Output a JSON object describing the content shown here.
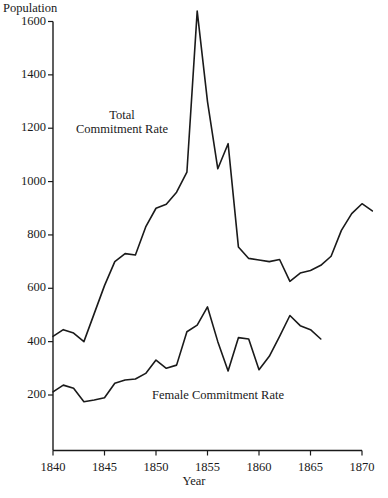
{
  "axes": {
    "y_title": "Population",
    "x_title": "Year",
    "y_ticks": [
      1600,
      1400,
      1200,
      1000,
      800,
      600,
      400,
      200
    ],
    "x_ticks": [
      1840,
      1845,
      1850,
      1855,
      1860,
      1865,
      1870
    ]
  },
  "labels": {
    "total_line1": "Total",
    "total_line2": "Commitment Rate",
    "female": "Female Commitment Rate"
  },
  "style": {
    "line_color": "#1a1a1a",
    "axis_color": "#1a1a1a",
    "background": "#ffffff"
  },
  "chart_data": {
    "type": "line",
    "title": "",
    "xlabel": "Year",
    "ylabel": "Population",
    "xlim": [
      1840,
      1870
    ],
    "ylim": [
      0,
      1600
    ],
    "grid": false,
    "legend": "inline-annotations",
    "x": [
      1840,
      1841,
      1842,
      1843,
      1844,
      1845,
      1846,
      1847,
      1848,
      1849,
      1850,
      1851,
      1852,
      1853,
      1854,
      1855,
      1856,
      1857,
      1858,
      1859,
      1860,
      1861,
      1862,
      1863,
      1864,
      1865,
      1866,
      1867,
      1868,
      1869,
      1870,
      1871
    ],
    "series": [
      {
        "name": "Total Commitment Rate",
        "values": [
          420,
          445,
          432,
          400,
          505,
          610,
          700,
          730,
          725,
          830,
          900,
          915,
          960,
          1035,
          1639,
          1300,
          1048,
          1142,
          755,
          712,
          706,
          700,
          708,
          626,
          657,
          667,
          686,
          720,
          817,
          880,
          917,
          890
        ]
      },
      {
        "name": "Female Commitment Rate",
        "values": [
          212,
          237,
          225,
          175,
          181,
          190,
          244,
          256,
          260,
          281,
          331,
          300,
          312,
          437,
          462,
          530,
          400,
          290,
          415,
          410,
          295,
          345,
          420,
          498,
          460,
          445,
          410,
          null,
          null,
          null,
          null,
          null
        ]
      }
    ]
  }
}
